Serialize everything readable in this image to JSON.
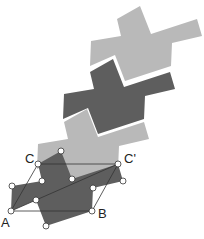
{
  "diagram": {
    "type": "tessellation",
    "colors": {
      "light": "#b9b9b9",
      "dark": "#5e5e5e",
      "line": "#333333",
      "vertex": "#ffffff"
    },
    "labels": {
      "A": "A",
      "B": "B",
      "C": "C",
      "C_prime": "C'"
    },
    "tiles": [
      {
        "shade": "light",
        "offset": [
          64,
          -146
        ]
      },
      {
        "shade": "dark",
        "offset": [
          48,
          -92
        ]
      },
      {
        "shade": "light",
        "offset": [
          18,
          -36
        ]
      },
      {
        "shade": "dark",
        "offset": [
          0,
          0
        ]
      }
    ]
  }
}
